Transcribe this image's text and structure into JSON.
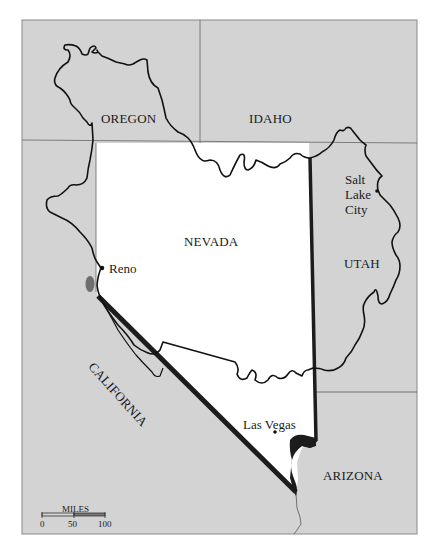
{
  "map": {
    "colors": {
      "surrounding_fill": "#d3d3d3",
      "nevada_fill": "#ffffff",
      "border_line": "#555555",
      "nevada_boundary": "#1c1c1c",
      "watershed_line": "#111111",
      "lake_fill": "#6e6e6e"
    },
    "states": [
      {
        "id": "oregon",
        "label": "OREGON"
      },
      {
        "id": "idaho",
        "label": "IDAHO"
      },
      {
        "id": "nevada",
        "label": "NEVADA"
      },
      {
        "id": "utah",
        "label": "UTAH"
      },
      {
        "id": "california",
        "label": "CALIFORNIA"
      },
      {
        "id": "arizona",
        "label": "ARIZONA"
      }
    ],
    "cities": [
      {
        "id": "reno",
        "label": "Reno"
      },
      {
        "id": "salt-lake-city",
        "label_lines": [
          "Salt",
          "Lake",
          "City"
        ]
      },
      {
        "id": "las-vegas",
        "label": "Las Vegas"
      }
    ],
    "scale_bar": {
      "title": "MILES",
      "ticks": [
        "0",
        "50",
        "100"
      ]
    }
  }
}
